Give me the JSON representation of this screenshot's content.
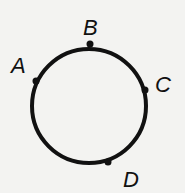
{
  "diagram": {
    "type": "circle-with-points",
    "circle": {
      "cx": 89,
      "cy": 106,
      "r": 57,
      "stroke": "#111111",
      "stroke_width": 4
    },
    "points": [
      {
        "label": "A",
        "x": 36,
        "y": 81,
        "label_x": 11,
        "label_y": 73
      },
      {
        "label": "B",
        "x": 90,
        "y": 44,
        "label_x": 83,
        "label_y": 35
      },
      {
        "label": "C",
        "x": 145,
        "y": 90,
        "label_x": 155,
        "label_y": 92
      },
      {
        "label": "D",
        "x": 108,
        "y": 162,
        "label_x": 123,
        "label_y": 187
      }
    ]
  },
  "labels": {
    "a": "A",
    "b": "B",
    "c": "C",
    "d": "D"
  }
}
